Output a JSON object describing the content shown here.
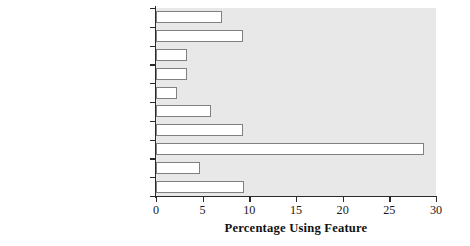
{
  "chart_data": {
    "type": "bar",
    "orientation": "horizontal",
    "title": "",
    "xlabel": "Percentage Using Feature",
    "ylabel": "",
    "xlim": [
      0,
      30
    ],
    "xticks": [
      0,
      5,
      10,
      15,
      20,
      25,
      30
    ],
    "grid": false,
    "legend": false,
    "categories": [
      "Kitchen accessible",
      "Bathroom accessible",
      "Modified sink/cabinets",
      "Modified sockets/switches",
      "Push bars on doors",
      "Door handles",
      "Wide doors/hallways",
      "Handrails/grab bars",
      "Elevator/stair lifts",
      "Ramps"
    ],
    "values": [
      7.1,
      9.3,
      3.3,
      3.3,
      2.3,
      5.9,
      9.3,
      28.7,
      4.7,
      9.4
    ]
  },
  "style": {
    "plot_background": "#e8e8e8",
    "bar_fill": "#ffffff",
    "bar_edge": "#808080",
    "axis_color": "#2a2a2a",
    "text_color": "#1a1a1a"
  }
}
